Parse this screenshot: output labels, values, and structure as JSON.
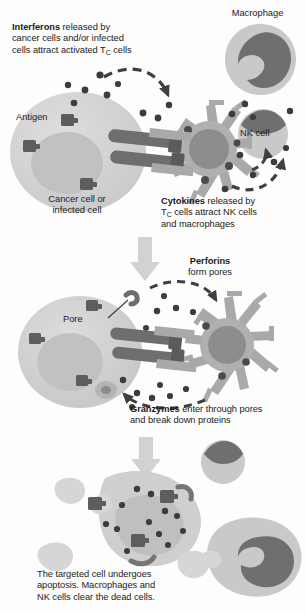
{
  "figure": {
    "width": 306,
    "height": 613
  },
  "colors": {
    "background": "#fdfdfd",
    "cell_body": "#d2d2d2",
    "cell_body_light": "#dcdcdc",
    "nucleus": "#bdbdbd",
    "dark_organelle": "#6b6b6b",
    "tcell_body": "#adadad",
    "tcell_nucleus": "#8e8e8e",
    "granule_dark": "#5f5f5f",
    "receptor_dark": "#6e6e6e",
    "macrophage_cyto": "#c9c9c9",
    "macrophage_nucleus": "#6f6f6f",
    "arrow_gray": "#cfcfcf",
    "dashed_arrow": "#4a4a4a",
    "text": "#1b1b1b"
  },
  "panels": [
    {
      "id": "panel-1",
      "caption_bold": "Interferons",
      "caption_rest": " released by\ncancer cells and/or infected\ncells attract activated T",
      "caption_sub": "C",
      "caption_tail": " cells"
    },
    {
      "id": "panel-2",
      "caption_bold": "Cytokines",
      "caption_rest": " released by\nT",
      "caption_sub": "C",
      "caption_tail": " cells attract NK cells\nand macrophages"
    },
    {
      "id": "panel-3",
      "caption_bold": "Perforins",
      "caption_rest": "\nform pores"
    },
    {
      "id": "panel-4",
      "caption_bold": "Granzymes",
      "caption_rest": " enter through pores\nand break down proteins"
    },
    {
      "id": "panel-5",
      "caption_rest": "The targeted cell undergoes\napoptosis. Macrophages and\nNK cells clear the dead cells."
    }
  ],
  "captions": {
    "interferons": {
      "bold": "Interferons",
      "line1_rest": " released by",
      "line2": "cancer cells and/or infected",
      "line3_pre": "cells attract activated T",
      "line3_sub": "C",
      "line3_post": " cells"
    },
    "cytokines": {
      "bold": "Cytokines",
      "line1_rest": " released by",
      "line2_pre": "T",
      "line2_sub": "C",
      "line2_post": " cells attract NK cells",
      "line3": "and macrophages"
    },
    "perforins": {
      "bold": "Perforins",
      "line2": "form pores"
    },
    "granzymes": {
      "bold": "Granzymes",
      "line1_rest": " enter through pores",
      "line2": "and break down proteins"
    },
    "apoptosis": {
      "line1": "The targeted cell undergoes",
      "line2": "apoptosis. Macrophages and",
      "line3": "NK cells clear the dead cells."
    }
  },
  "labels": {
    "macrophage": "Macrophage",
    "nk_cell": "NK cell",
    "antigen": "Antigen",
    "cancer_cell": "Cancer cell or\ninfected cell",
    "pore": "Pore"
  },
  "elements": {
    "cancer_cell_top": "cancer-or-infected-cell",
    "cancer_cell_middle": "cancer-cell-with-pores",
    "apoptotic_cell": "apoptotic-cell-fragments",
    "t_cell_top": "cytotoxic-t-cell",
    "t_cell_middle": "cytotoxic-t-cell",
    "macrophage_top": "macrophage",
    "macrophage_bottom": "macrophage",
    "nk_cell_top": "nk-cell",
    "nk_cell_bottom": "nk-cell",
    "interferon_dots": "interferon-molecules",
    "cytokine_dots": "cytokine-molecules",
    "perforin_dots": "perforin-molecules",
    "granzyme_dots": "granzyme-molecules",
    "antigen_blocks": "antigen-mhc-complexes",
    "tcr_receptors": "t-cell-receptors",
    "flow_arrow_1": "downward-flow-arrow",
    "flow_arrow_2": "downward-flow-arrow",
    "dashed_arrow_interferon": "interferon-attraction-arrow",
    "dashed_arrow_cytokine": "cytokine-attraction-arrow",
    "dashed_arrow_perforin": "perforin-release-arrow",
    "dashed_arrow_granzyme": "granzyme-entry-arrow"
  }
}
